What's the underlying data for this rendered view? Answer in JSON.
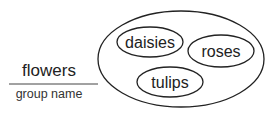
{
  "group": {
    "value": "flowers",
    "caption": "group name"
  },
  "members": [
    "daisies",
    "roses",
    "tulips"
  ]
}
